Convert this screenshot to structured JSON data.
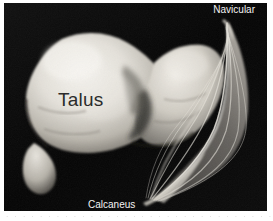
{
  "figure": {
    "kind": "anatomical-photograph",
    "background_color": "#050505",
    "bone_color": "#e8e5df",
    "ligament_color": "#d8d4cc",
    "page_background": "#ffffff"
  },
  "labels": {
    "navicular": "Navicular",
    "calcaneus": "Calcaneus",
    "talus": "Talus"
  },
  "caption": {
    "ghost_line": "· · · · · · · · · · · · · · · · · · · · · · · · · · · · · · · ·"
  }
}
